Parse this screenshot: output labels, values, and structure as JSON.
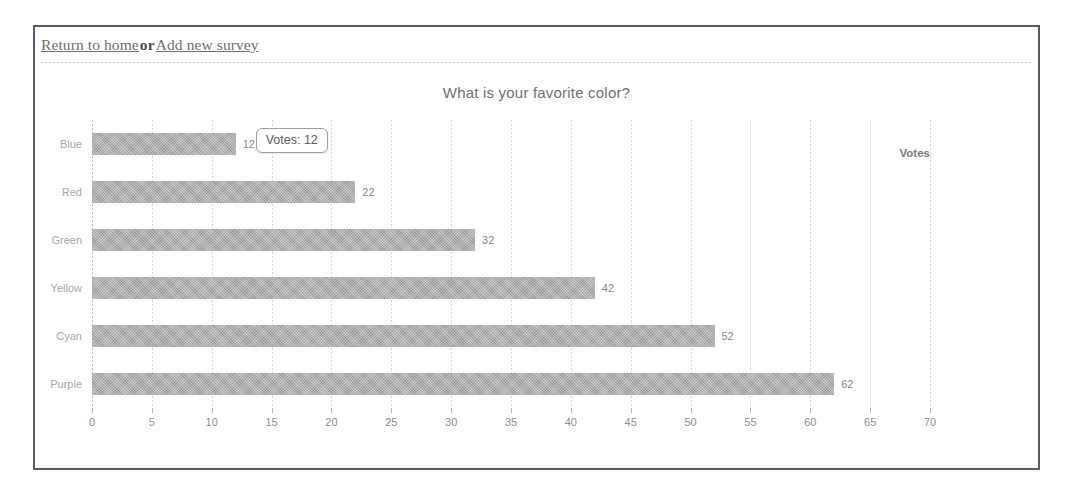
{
  "header": {
    "link_home": "Return to home",
    "separator": "or",
    "link_new_survey": "Add new survey"
  },
  "tooltip": {
    "text": "Votes: 12"
  },
  "chart_data": {
    "type": "bar",
    "orientation": "horizontal",
    "title": "What is your favorite color?",
    "categories": [
      "Blue",
      "Red",
      "Green",
      "Yellow",
      "Cyan",
      "Purple"
    ],
    "values": [
      12,
      22,
      32,
      42,
      52,
      62
    ],
    "value_labels": [
      "12",
      "22",
      "32",
      "42",
      "52",
      "62"
    ],
    "xlabel": "Votes",
    "ylabel": "",
    "xlim": [
      0,
      70
    ],
    "xticks": [
      0,
      5,
      10,
      15,
      20,
      25,
      30,
      35,
      40,
      45,
      50,
      55,
      60,
      65,
      70
    ],
    "xtick_labels": [
      "0",
      "5",
      "10",
      "15",
      "20",
      "25",
      "30",
      "35",
      "40",
      "45",
      "50",
      "55",
      "60",
      "65",
      "70"
    ],
    "grid": true,
    "legend": false,
    "bar_color": "#9a9a9a",
    "title_color": "#6f6f6f",
    "tick_color": "#8e8e8e"
  }
}
